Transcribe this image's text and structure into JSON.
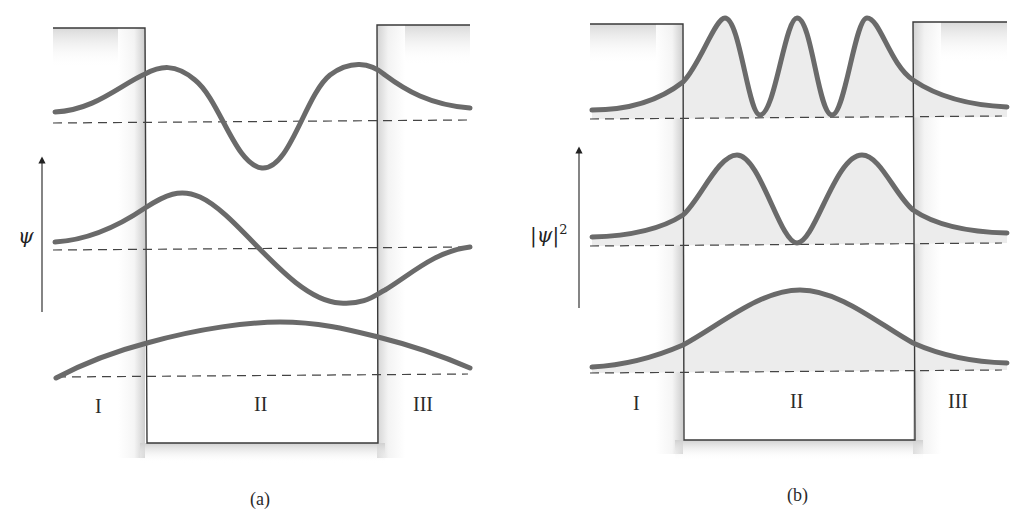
{
  "panels": [
    {
      "id": "a",
      "caption": "(a)",
      "y_axis_label": "ψ",
      "regions": [
        "I",
        "II",
        "III"
      ],
      "curves": [
        "ground state ψ (n=1)",
        "first excited ψ (n=2)",
        "second excited ψ (n=3)"
      ]
    },
    {
      "id": "b",
      "caption": "(b)",
      "y_axis_label": "|ψ|",
      "y_axis_superscript": "2",
      "regions": [
        "I",
        "II",
        "III"
      ],
      "curves": [
        "|ψ|² (n=1)",
        "|ψ|² (n=2)",
        "|ψ|² (n=3)"
      ]
    }
  ],
  "colors": {
    "curve": "#6a6a6a",
    "well_outline": "#3a3a3a",
    "baseline_dash": "#444444",
    "shading": "#d8d8d8"
  }
}
